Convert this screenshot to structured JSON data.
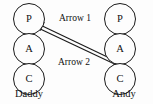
{
  "diagram": {
    "type": "transactional-analysis-pac",
    "line_color": "#1a1a1a",
    "background_color": "#fdfdfd",
    "persons": [
      {
        "name": "Daddy",
        "side": "left",
        "ego_states": [
          {
            "code": "P"
          },
          {
            "code": "A"
          },
          {
            "code": "C"
          }
        ]
      },
      {
        "name": "Andy",
        "side": "right",
        "ego_states": [
          {
            "code": "P"
          },
          {
            "code": "A"
          },
          {
            "code": "C"
          }
        ]
      }
    ],
    "arrows": [
      {
        "label": "Arrow 1",
        "direction": "right-to-left",
        "from": "Andy.C",
        "to": "Daddy.P"
      },
      {
        "label": "Arrow 2",
        "direction": "left-to-right",
        "from": "Daddy.P",
        "to": "Andy.C"
      }
    ]
  }
}
